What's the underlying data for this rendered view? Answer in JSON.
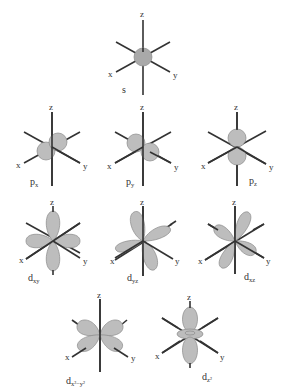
{
  "diagram": {
    "axis_labels": {
      "x": "x",
      "y": "y",
      "z": "z"
    },
    "colors": {
      "lobe_fill": "#bdbdbd",
      "lobe_stroke": "#8a8a8a",
      "axis": "#333333",
      "text": "#333333",
      "background": "#ffffff"
    },
    "orbitals": [
      {
        "id": "s",
        "label_main": "s",
        "label_sub": "",
        "row": 1
      },
      {
        "id": "px",
        "label_main": "p",
        "label_sub": "x",
        "row": 2
      },
      {
        "id": "py",
        "label_main": "p",
        "label_sub": "y",
        "row": 2
      },
      {
        "id": "pz",
        "label_main": "p",
        "label_sub": "z",
        "row": 2
      },
      {
        "id": "dxy",
        "label_main": "d",
        "label_sub": "xy",
        "row": 3
      },
      {
        "id": "dyz",
        "label_main": "d",
        "label_sub": "yz",
        "row": 3
      },
      {
        "id": "dxz",
        "label_main": "d",
        "label_sub": "xz",
        "row": 3
      },
      {
        "id": "dx2y2",
        "label_main": "d",
        "label_sub": "x²−y²",
        "row": 4
      },
      {
        "id": "dz2",
        "label_main": "d",
        "label_sub": "z²",
        "row": 4
      }
    ]
  }
}
